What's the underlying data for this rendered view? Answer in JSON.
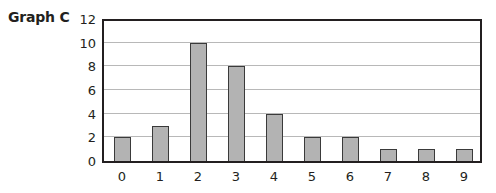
{
  "chart_data": {
    "type": "bar",
    "title": "Graph C",
    "categories": [
      "0",
      "1",
      "2",
      "3",
      "4",
      "5",
      "6",
      "7",
      "8",
      "9"
    ],
    "values": [
      2,
      3,
      10,
      8,
      4,
      2,
      2,
      1,
      1,
      1
    ],
    "xlabel": "",
    "ylabel": "",
    "ylim": [
      0,
      12
    ],
    "yticks": [
      "0",
      "2",
      "4",
      "6",
      "8",
      "10",
      "12"
    ],
    "grid": true,
    "bar_color": "#b3b3b3",
    "bar_edge_color": "#3a3a3a",
    "grid_color": "#b8b8b8"
  }
}
